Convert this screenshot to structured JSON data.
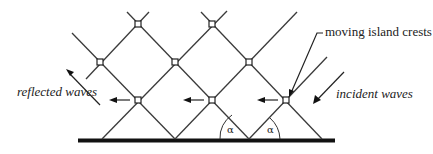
{
  "diagram": {
    "labels": {
      "reflected": "reflected waves",
      "incident": "incident waves",
      "crests": "moving island crests",
      "angle_left": "α",
      "angle_right": "α"
    },
    "nodes": [
      {
        "x": 138,
        "y": 24
      },
      {
        "x": 212,
        "y": 24
      },
      {
        "x": 100,
        "y": 62
      },
      {
        "x": 175,
        "y": 62
      },
      {
        "x": 249,
        "y": 62
      },
      {
        "x": 138,
        "y": 100
      },
      {
        "x": 212,
        "y": 100
      },
      {
        "x": 286,
        "y": 100
      }
    ],
    "colors": {
      "line": "#3a3a3a",
      "base": "#111111",
      "background": "#ffffff"
    }
  }
}
